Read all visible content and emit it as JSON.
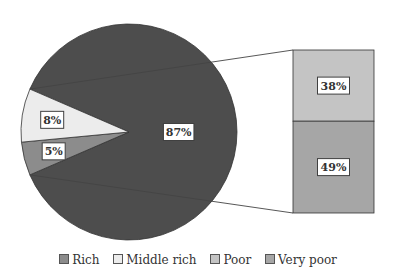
{
  "chart_data": {
    "type": "pie",
    "subtype": "bar-of-pie",
    "title": "",
    "pie": {
      "slices": [
        {
          "name": "Other (Poor + Very poor)",
          "value": 87,
          "label": "87%",
          "color": "#4d4d4d"
        },
        {
          "name": "Rich",
          "value": 5,
          "label": "5%",
          "color": "#8c8c8c"
        },
        {
          "name": "Middle rich",
          "value": 8,
          "label": "8%",
          "color": "#ececec"
        }
      ]
    },
    "bar": {
      "segments": [
        {
          "name": "Poor",
          "value": 38,
          "label": "38%",
          "color": "#c4c4c4"
        },
        {
          "name": "Very poor",
          "value": 49,
          "label": "49%",
          "color": "#a6a6a6"
        }
      ]
    },
    "legend": {
      "position": "bottom",
      "entries": [
        {
          "label": "Rich",
          "color": "#8c8c8c"
        },
        {
          "label": "Middle rich",
          "color": "#ececec"
        },
        {
          "label": "Poor",
          "color": "#c4c4c4"
        },
        {
          "label": "Very poor",
          "color": "#a6a6a6"
        }
      ]
    }
  }
}
